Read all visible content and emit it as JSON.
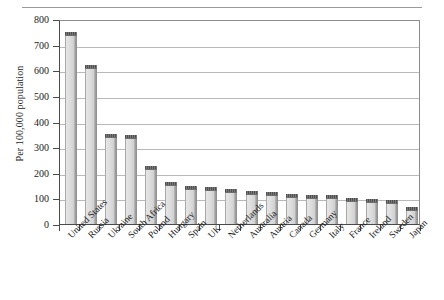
{
  "chart_data": {
    "type": "bar",
    "title": "",
    "xlabel": "",
    "ylabel": "Per 100,000 population",
    "ylim": [
      0,
      800
    ],
    "ytick_labels": [
      "800",
      "700",
      "600",
      "500",
      "400",
      "300",
      "200",
      "100",
      "0"
    ],
    "ytick_values": [
      800,
      700,
      600,
      500,
      400,
      300,
      200,
      100,
      0
    ],
    "grid": true,
    "legend": null,
    "categories": [
      "United States",
      "Russia",
      "Ukraine",
      "South Africa",
      "Poland",
      "Hungary",
      "Spain",
      "UK",
      "Netherlands",
      "Australia",
      "Austria",
      "Canada",
      "Germany",
      "Italy",
      "France",
      "Ireland",
      "Sweden",
      "Japan"
    ],
    "values": [
      750,
      620,
      352,
      348,
      228,
      164,
      148,
      146,
      137,
      130,
      124,
      119,
      115,
      113,
      101,
      98,
      95,
      65
    ],
    "series": [
      {
        "name": "Incarceration rate",
        "values": [
          750,
          620,
          352,
          348,
          228,
          164,
          148,
          146,
          137,
          130,
          124,
          119,
          115,
          113,
          101,
          98,
          95,
          65
        ]
      }
    ],
    "colors": {
      "bar_fill": "#d8d8d8",
      "bar_edge": "#8e8e8e",
      "bar_top": "#5c5c5c",
      "gridline": "#b9b9b9",
      "axis": "#4a4a4a",
      "text": "#1a1a1a"
    }
  }
}
